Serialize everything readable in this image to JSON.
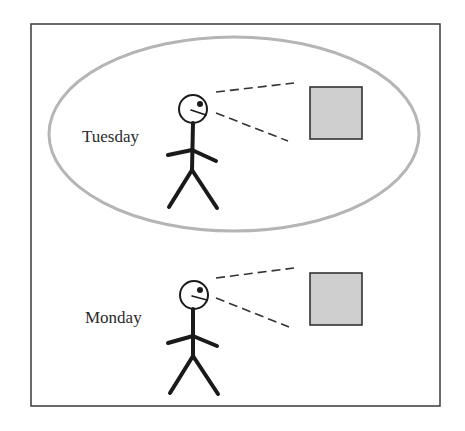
{
  "colors": {
    "frame": "#3a3a3a",
    "ellipse": "#b5b5b5",
    "figure": "#1a1a1a",
    "object_fill": "#cfcfcf",
    "object_stroke": "#333333"
  },
  "scenes": [
    {
      "label": "Tuesday",
      "highlighted": true,
      "figure": "stick-figure-looking-right",
      "object": "gray-square"
    },
    {
      "label": "Monday",
      "highlighted": false,
      "figure": "stick-figure-looking-right",
      "object": "gray-square"
    }
  ]
}
